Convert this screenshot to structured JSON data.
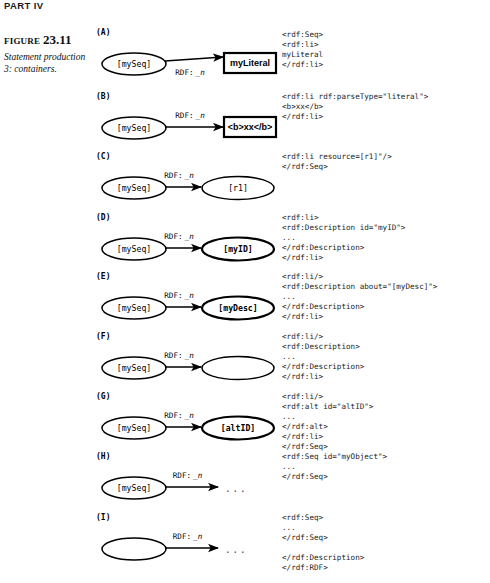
{
  "page": {
    "running_head": "PART IV",
    "figure_label_word": "FIGURE",
    "figure_number": "23.11",
    "figure_caption": "Statement production 3: containers."
  },
  "diagram": {
    "type": "rdf-graph-series",
    "edge_label_prefix": "RDF:",
    "edge_label_suffix": "_n",
    "ellipsis": "...",
    "panels": [
      {
        "letter": "(A)",
        "source": {
          "label": "[mySeq]",
          "shape": "ellipse",
          "bold": false
        },
        "target": {
          "label": "myLiteral",
          "shape": "rect",
          "bold": true
        },
        "edge": {
          "label_prefix": "RDF:",
          "label_suffix": "_n",
          "label_position": "below"
        },
        "code": "<rdf:Seq>\n<rdf:li>\nmyLiteral\n</rdf:li>"
      },
      {
        "letter": "(B)",
        "source": {
          "label": "[mySeq]",
          "shape": "ellipse",
          "bold": false
        },
        "target": {
          "label": "<b>xx</b>",
          "shape": "rect",
          "bold": true
        },
        "edge": {
          "label_prefix": "RDF:",
          "label_suffix": "_n",
          "label_position": "above"
        },
        "code": "<rdf:li rdf:parseType=\"literal\">\n<b>xx</b>\n</rdf:li>"
      },
      {
        "letter": "(C)",
        "source": {
          "label": "[mySeq]",
          "shape": "ellipse",
          "bold": false
        },
        "target": {
          "label": "[r1]",
          "shape": "ellipse",
          "bold": false
        },
        "edge": {
          "label_prefix": "RDF:",
          "label_suffix": "_n",
          "label_position": "above"
        },
        "code": "<rdf:li resource=[r1]\"/>\n</rdf:Seq>"
      },
      {
        "letter": "(D)",
        "source": {
          "label": "[mySeq]",
          "shape": "ellipse",
          "bold": false
        },
        "target": {
          "label": "[myID]",
          "shape": "ellipse",
          "bold": true
        },
        "edge": {
          "label_prefix": "RDF:",
          "label_suffix": "_n",
          "label_position": "above"
        },
        "code": "<rdf:li>\n<rdf:Description id=\"myID\">\n...\n</rdf:Description>\n</rdf:li>"
      },
      {
        "letter": "(E)",
        "source": {
          "label": "[mySeq]",
          "shape": "ellipse",
          "bold": false
        },
        "target": {
          "label": "[myDesc]",
          "shape": "ellipse",
          "bold": true
        },
        "edge": {
          "label_prefix": "RDF:",
          "label_suffix": "_n",
          "label_position": "above"
        },
        "code": "<rdf:li/>\n<rdf:Description about=\"[myDesc]\">\n...\n</rdf:Description>\n</rdf:li>"
      },
      {
        "letter": "(F)",
        "source": {
          "label": "[mySeq]",
          "shape": "ellipse",
          "bold": false
        },
        "target": {
          "label": "",
          "shape": "ellipse",
          "bold": false
        },
        "edge": {
          "label_prefix": "RDF:",
          "label_suffix": "_n",
          "label_position": "above"
        },
        "code": "<rdf:li/>\n<rdf:Description>\n...\n</rdf:Description>\n</rdf:li>"
      },
      {
        "letter": "(G)",
        "source": {
          "label": "[mySeq]",
          "shape": "ellipse",
          "bold": false
        },
        "target": {
          "label": "[altID]",
          "shape": "ellipse",
          "bold": true
        },
        "edge": {
          "label_prefix": "RDF:",
          "label_suffix": "_n",
          "label_position": "above"
        },
        "code": "<rdf:li/>\n<rdf:alt id=\"altID\">\n...\n</rdf:alt>\n</rdf:li>\n</rdf:Seq>"
      },
      {
        "letter": "(H)",
        "source": {
          "label": "[mySeq]",
          "shape": "ellipse",
          "bold": false
        },
        "target": {
          "label": "...",
          "shape": "ellipsis",
          "bold": false
        },
        "edge": {
          "label_prefix": "RDF:",
          "label_suffix": "_n",
          "label_position": "above"
        },
        "code": "<rdf:Seq id=\"myObject\">\n...\n</rdf:Seq>"
      },
      {
        "letter": "(I)",
        "source": {
          "label": "",
          "shape": "ellipse",
          "bold": false
        },
        "target": {
          "label": "...",
          "shape": "ellipsis",
          "bold": false
        },
        "edge": {
          "label_prefix": "RDF:",
          "label_suffix": "_n",
          "label_position": "above"
        },
        "code": "<rdf:Seq>\n...\n</rdf:Seq>\n\n</rdf:Description>\n</rdf:RDF>"
      }
    ]
  }
}
